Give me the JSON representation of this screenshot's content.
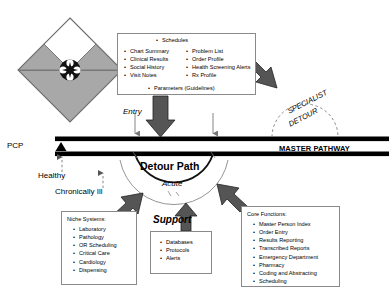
{
  "diagram": {
    "title_labels": {
      "pcp": "PCP",
      "master_pathway": "MASTER PATHWAY",
      "entry": "Entry",
      "detour_path": "Detour Path",
      "acute": "Acute",
      "support": "Support",
      "healthy": "Healthy",
      "chronically_ill": "Chronically Ill",
      "specialist": "SPECIALIST",
      "detour": "DETOUR"
    },
    "data_box": {
      "schedules": "Schedules",
      "left_items": [
        "Chart Summary",
        "Clinical Results",
        "Social History",
        "Visit Notes"
      ],
      "right_items": [
        "Problem List",
        "Order Profile",
        "Health Screening Alerts",
        "Rx Profile"
      ],
      "parameters": "Parameters (Guidelines)"
    },
    "niche_box": {
      "title": "Niche Systems:",
      "items": [
        "Laboratory",
        "Pathology",
        "OR Scheduling",
        "Critical Care",
        "Cardiology",
        "Dispensing"
      ]
    },
    "support_box": {
      "items": [
        "Databases",
        "Protocols",
        "Alerts"
      ]
    },
    "core_box": {
      "title": "Core Functions:",
      "items": [
        "Master Person Index",
        "Order Entry",
        "Results Reporting",
        "Transcribed Reports",
        "Emergency Department",
        "Pharmacy",
        "Coding and Abstracting",
        "Scheduling"
      ]
    },
    "colors": {
      "diamond_fill": "#a8a8a8",
      "diamond_top_fill": "#ffffff",
      "pathway_bar": "#000000",
      "arrow_gray": "#555555",
      "box_border": "#8a8a8a",
      "dashed_arc": "#777777"
    }
  }
}
